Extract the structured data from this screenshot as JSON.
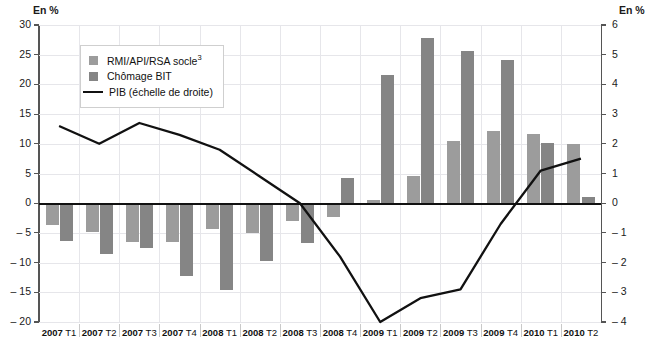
{
  "axes": {
    "left_unit": "En %",
    "right_unit": "En %",
    "left_ticks": [
      "30",
      "25",
      "20",
      "15",
      "10",
      "5",
      "0",
      "– 5",
      "– 10",
      "– 15",
      "– 20"
    ],
    "right_ticks": [
      "6",
      "5",
      "4",
      "3",
      "2",
      "1",
      "0",
      "– 1",
      "– 2",
      "– 3",
      "– 4"
    ]
  },
  "legend": {
    "items": [
      {
        "label": "RMI/API/RSA socle",
        "note": "3",
        "type": "bar",
        "color": "#9c9c9c"
      },
      {
        "label": "Chômage BIT",
        "note": "",
        "type": "bar",
        "color": "#858585"
      },
      {
        "label": "PIB (échelle de droite)",
        "note": "",
        "type": "line",
        "color": "#111111"
      }
    ]
  },
  "chart_data": {
    "type": "bar",
    "title": "",
    "xlabel": "",
    "ylabel": "En %",
    "ylim": [
      -20,
      30
    ],
    "y2lim": [
      -4,
      6
    ],
    "grid": true,
    "legend_position": "top-left",
    "categories": [
      "2007 T1",
      "2007 T2",
      "2007 T3",
      "2007 T4",
      "2008 T1",
      "2008 T2",
      "2008 T3",
      "2008 T4",
      "2009 T1",
      "2009 T2",
      "2009 T3",
      "2009 T4",
      "2010 T1",
      "2010 T2"
    ],
    "series": [
      {
        "name": "RMI/API/RSA socle",
        "axis": "left",
        "type": "bar",
        "color": "#9c9c9c",
        "values": [
          -3.6,
          -4.9,
          -6.6,
          -6.5,
          -4.4,
          -5.1,
          -3.0,
          -2.3,
          0.5,
          4.6,
          10.4,
          12.2,
          11.6,
          9.9
        ]
      },
      {
        "name": "Chômage BIT",
        "axis": "left",
        "type": "bar",
        "color": "#858585",
        "values": [
          -6.4,
          -8.6,
          -7.5,
          -12.2,
          -14.7,
          -9.8,
          -6.7,
          4.2,
          21.6,
          27.9,
          25.7,
          24.2,
          10.1,
          1.1
        ]
      },
      {
        "name": "PIB (échelle de droite)",
        "axis": "right",
        "type": "line",
        "color": "#111111",
        "values": [
          2.6,
          2.0,
          2.7,
          2.3,
          1.8,
          0.9,
          0.0,
          -1.8,
          -4.0,
          -3.2,
          -2.9,
          -0.7,
          1.1,
          1.5
        ]
      }
    ]
  }
}
